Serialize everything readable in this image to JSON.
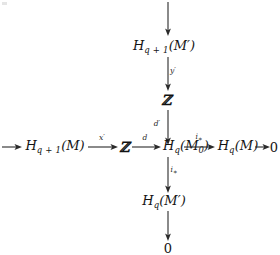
{
  "figure": {
    "kind": "commutative-diagram",
    "background_color": "#ffffff",
    "ink_color": "#1d1d1d"
  },
  "nodes": {
    "top_column": {
      "h_q1_mprime": {
        "label": "H_{q+1}(M')",
        "base": "H",
        "sub": "q + 1",
        "arg": "(M′)"
      },
      "zed_top": {
        "label": "ℤ"
      }
    },
    "row": {
      "left_entry": {
        "label": "H_{q+1}(M)",
        "base": "H",
        "sub": "q + 1",
        "arg": "(M)"
      },
      "zed_mid": {
        "label": "ℤ"
      },
      "h_q_m0": {
        "label": "H_q(M_0)",
        "base": "H",
        "sub": "q",
        "arg": "(M",
        "arg_sub": "0",
        "arg_close": ")"
      },
      "h_q_m": {
        "label": "H_q(M)",
        "base": "H",
        "sub": "q",
        "arg": "(M)"
      },
      "right_zero": {
        "label": "0"
      }
    },
    "bottom_column": {
      "h_q_mprime": {
        "label": "H_q(M')",
        "base": "H",
        "sub": "q",
        "arg": "(M′)"
      },
      "bottom_zero": {
        "label": "0"
      }
    }
  },
  "edges": {
    "top_incoming": {
      "label": "",
      "direction": "down"
    },
    "gamma_prime": {
      "label": "y′",
      "base": "y",
      "prime": "′",
      "direction": "down"
    },
    "d_prime": {
      "label": "d′",
      "base": "d",
      "prime": "′",
      "direction": "down"
    },
    "left_incoming": {
      "label": "",
      "direction": "right"
    },
    "x_prime": {
      "label": "x′",
      "base": "x",
      "prime": "′",
      "direction": "right"
    },
    "d": {
      "label": "d",
      "base": "d",
      "prime": "",
      "direction": "right"
    },
    "i_star_row": {
      "label": "i∗",
      "base": "i",
      "star": "∗",
      "direction": "right"
    },
    "to_zero_right": {
      "label": "",
      "direction": "right"
    },
    "i_star_down": {
      "label": "i∗",
      "base": "i",
      "star": "∗",
      "direction": "down"
    },
    "to_zero_bottom": {
      "label": "",
      "direction": "down"
    }
  }
}
